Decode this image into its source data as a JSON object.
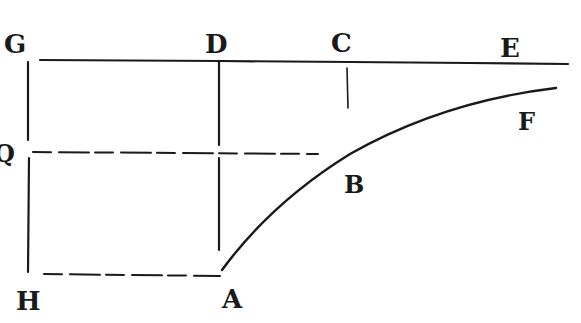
{
  "figure": {
    "kind": "geometric-construction",
    "colors": {
      "ink": "#1a1a1a",
      "background": "#ffffff"
    },
    "labels": {
      "G": "G",
      "D": "D",
      "C": "C",
      "E": "E",
      "F": "F",
      "Q": "Q",
      "B": "B",
      "H": "H",
      "A": "A"
    },
    "lines": [
      {
        "name": "top-line-GE",
        "style": "solid",
        "from": "G",
        "to": "E"
      },
      {
        "name": "vertical-GH",
        "style": "solid",
        "from": "G",
        "to": "H"
      },
      {
        "name": "vertical-DA",
        "style": "solid",
        "from": "D",
        "to": "A"
      },
      {
        "name": "tick-C",
        "style": "solid",
        "from": "C",
        "to": "below C"
      },
      {
        "name": "dashed-QB",
        "style": "dashed",
        "from": "Q",
        "to": "B"
      },
      {
        "name": "dashed-HA",
        "style": "dashed",
        "from": "H",
        "to": "A"
      }
    ],
    "curve": {
      "name": "curve-ABF",
      "through": [
        "A",
        "B",
        "F"
      ]
    }
  }
}
